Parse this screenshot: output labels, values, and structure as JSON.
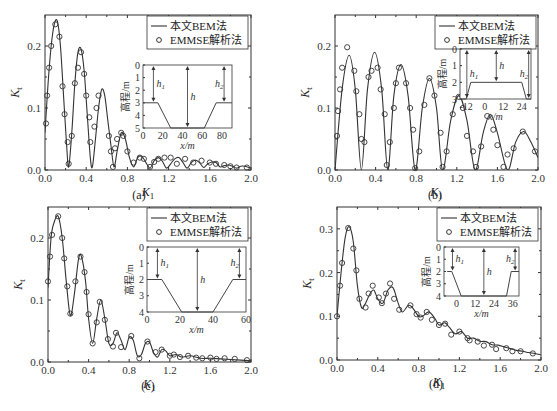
{
  "figure": {
    "legend": {
      "line_label": "本文BEM法",
      "marker_label": "EMMSE解析法"
    },
    "inset_ylabel": "高程/m",
    "inset_xlabel": "x/m",
    "inset_h1": "h",
    "inset_h": "h",
    "inset_h2": "h"
  },
  "chart_data": [
    {
      "id": "a",
      "caption": "(a)",
      "type": "line",
      "xlabel": "K_1",
      "ylabel": "K_t",
      "xlim": [
        0,
        2.0
      ],
      "ylim": [
        0,
        0.25
      ],
      "xticks": [
        "0.0",
        "0.4",
        "0.8",
        "1.2",
        "1.6",
        "2.0"
      ],
      "yticks": [
        "0.0",
        "0.1",
        "0.2"
      ],
      "legend_position": "upper right",
      "series": [
        {
          "name": "本文BEM法",
          "style": "line",
          "x": [
            0,
            0.03,
            0.06,
            0.09,
            0.12,
            0.15,
            0.18,
            0.21,
            0.23,
            0.26,
            0.29,
            0.32,
            0.35,
            0.38,
            0.41,
            0.44,
            0.46,
            0.49,
            0.52,
            0.55,
            0.58,
            0.61,
            0.64,
            0.67,
            0.7,
            0.74,
            0.78,
            0.82,
            0.86,
            0.9,
            0.94,
            0.98,
            1.02,
            1.06,
            1.1,
            1.14,
            1.18,
            1.22,
            1.26,
            1.3,
            1.34,
            1.38,
            1.42,
            1.46,
            1.5,
            1.54,
            1.58,
            1.62,
            1.66,
            1.7,
            1.74,
            1.78,
            1.82,
            1.86,
            1.9,
            1.94,
            2.0
          ],
          "y": [
            0.06,
            0.14,
            0.2,
            0.235,
            0.24,
            0.2,
            0.12,
            0.04,
            0.005,
            0.06,
            0.14,
            0.19,
            0.195,
            0.16,
            0.09,
            0.02,
            0.005,
            0.05,
            0.1,
            0.13,
            0.12,
            0.08,
            0.04,
            0.005,
            0.03,
            0.06,
            0.05,
            0.02,
            0.005,
            0.02,
            0.022,
            0.012,
            0.003,
            0.015,
            0.02,
            0.014,
            0.003,
            0.01,
            0.018,
            0.02,
            0.012,
            0.003,
            0.012,
            0.016,
            0.012,
            0.004,
            0.01,
            0.013,
            0.012,
            0.005,
            0.007,
            0.008,
            0.006,
            0.003,
            0.006,
            0.006,
            0.003
          ]
        },
        {
          "name": "EMMSE解析法",
          "style": "marker",
          "x": [
            0.01,
            0.02,
            0.04,
            0.06,
            0.1,
            0.14,
            0.17,
            0.19,
            0.22,
            0.23,
            0.26,
            0.29,
            0.32,
            0.35,
            0.38,
            0.4,
            0.43,
            0.44,
            0.48,
            0.5,
            0.52,
            0.62,
            0.64,
            0.66,
            0.68,
            0.7,
            0.74,
            0.76,
            0.8,
            0.86,
            0.92,
            0.96,
            1.02,
            1.06,
            1.1,
            1.16,
            1.22,
            1.28,
            1.36,
            1.44,
            1.52,
            1.6,
            1.66,
            1.74,
            1.8,
            1.86,
            1.96
          ],
          "y": [
            0.075,
            0.12,
            0.165,
            0.2,
            0.235,
            0.215,
            0.135,
            0.09,
            0.045,
            0.01,
            0.055,
            0.14,
            0.165,
            0.19,
            0.155,
            0.12,
            0.085,
            0.045,
            0.07,
            0.1,
            0.12,
            0.055,
            0.03,
            0.005,
            0.035,
            0.05,
            0.06,
            0.055,
            0.03,
            0.012,
            0.02,
            0.018,
            0.005,
            0.013,
            0.018,
            0.02,
            0.02,
            0.01,
            0.018,
            0.012,
            0.015,
            0.012,
            0.01,
            0.008,
            0.006,
            0.004,
            0.004
          ]
        }
      ],
      "inset": {
        "xticks": [
          "0",
          "20",
          "40",
          "60",
          "80"
        ],
        "yticks": [
          "0",
          "1",
          "2",
          "3",
          "4",
          "5"
        ],
        "profile": [
          [
            0,
            3
          ],
          [
            15,
            3
          ],
          [
            28,
            5
          ],
          [
            62,
            5
          ],
          [
            74,
            3
          ],
          [
            90,
            3
          ]
        ]
      }
    },
    {
      "id": "b",
      "caption": "(b)",
      "type": "line",
      "xlabel": "K_1",
      "ylabel": "K_t",
      "xlim": [
        0,
        2.0
      ],
      "ylim": [
        0,
        0.25
      ],
      "xticks": [
        "0.0",
        "0.4",
        "0.8",
        "1.2",
        "1.6",
        "2.0"
      ],
      "yticks": [
        "0.0",
        "0.1",
        "0.2"
      ],
      "legend_position": "upper right",
      "series": [
        {
          "name": "本文BEM法",
          "style": "line",
          "x": [
            0,
            0.07,
            0.14,
            0.2,
            0.26,
            0.32,
            0.39,
            0.46,
            0.52,
            0.58,
            0.65,
            0.72,
            0.79,
            0.86,
            0.93,
            1.0,
            1.06,
            1.14,
            1.22,
            1.3,
            1.38,
            1.46,
            1.53,
            1.6,
            1.7,
            1.78,
            1.86,
            1.93,
            2.0
          ],
          "y": [
            0,
            0.13,
            0.185,
            0.13,
            0.0,
            0.13,
            0.19,
            0.13,
            0.0,
            0.12,
            0.17,
            0.12,
            0.0,
            0.1,
            0.148,
            0.1,
            0.0,
            0.08,
            0.12,
            0.08,
            0.0,
            0.06,
            0.09,
            0.06,
            0.0,
            0.045,
            0.062,
            0.045,
            0.02
          ]
        },
        {
          "name": "EMMSE解析法",
          "style": "marker",
          "x": [
            0.02,
            0.03,
            0.05,
            0.07,
            0.12,
            0.19,
            0.21,
            0.24,
            0.26,
            0.29,
            0.33,
            0.36,
            0.42,
            0.45,
            0.49,
            0.51,
            0.54,
            0.58,
            0.6,
            0.63,
            0.7,
            0.74,
            0.77,
            0.79,
            0.83,
            0.88,
            0.93,
            0.98,
            1.04,
            1.06,
            1.1,
            1.16,
            1.22,
            1.26,
            1.3,
            1.36,
            1.39,
            1.44,
            1.5,
            1.56,
            1.6,
            1.66,
            1.7,
            1.76,
            1.85,
            1.97
          ],
          "y": [
            0.055,
            0.095,
            0.13,
            0.165,
            0.198,
            0.16,
            0.127,
            0.09,
            0.05,
            0.045,
            0.15,
            0.16,
            0.165,
            0.13,
            0.09,
            0.008,
            0.045,
            0.1,
            0.14,
            0.165,
            0.14,
            0.1,
            0.065,
            0.003,
            0.03,
            0.105,
            0.148,
            0.12,
            0.06,
            0.005,
            0.03,
            0.09,
            0.118,
            0.1,
            0.055,
            0.03,
            0.005,
            0.038,
            0.087,
            0.065,
            0.04,
            0.005,
            0.025,
            0.035,
            0.062,
            0.03
          ]
        }
      ],
      "inset": {
        "xticks": [
          "-12",
          "0",
          "12",
          "24"
        ],
        "yticks": [
          "0",
          "1",
          "2",
          "3"
        ],
        "profile": [
          [
            -15,
            3
          ],
          [
            -12,
            3
          ],
          [
            -9,
            2
          ],
          [
            24,
            2
          ],
          [
            27,
            3
          ],
          [
            30,
            3
          ]
        ]
      }
    },
    {
      "id": "c",
      "caption": "(c)",
      "type": "line",
      "xlabel": "K_1",
      "ylabel": "K_t",
      "xlim": [
        0,
        2.0
      ],
      "ylim": [
        0,
        0.25
      ],
      "xticks": [
        "0.0",
        "0.4",
        "0.8",
        "1.2",
        "1.6",
        "2.0"
      ],
      "yticks": [
        "0.0",
        "0.1",
        "0.2"
      ],
      "legend_position": "upper right",
      "series": [
        {
          "name": "本文BEM法",
          "style": "line",
          "x": [
            0,
            0.03,
            0.06,
            0.1,
            0.14,
            0.18,
            0.22,
            0.26,
            0.3,
            0.33,
            0.37,
            0.4,
            0.44,
            0.48,
            0.52,
            0.56,
            0.6,
            0.64,
            0.68,
            0.72,
            0.76,
            0.8,
            0.84,
            0.88,
            0.92,
            0.96,
            1.0,
            1.04,
            1.08,
            1.12,
            1.16,
            1.2,
            1.26,
            1.32,
            1.4,
            1.5,
            1.6,
            1.7,
            1.8,
            1.9,
            2.0
          ],
          "y": [
            0.12,
            0.2,
            0.225,
            0.235,
            0.2,
            0.13,
            0.075,
            0.11,
            0.165,
            0.17,
            0.13,
            0.07,
            0.03,
            0.07,
            0.1,
            0.07,
            0.03,
            0.03,
            0.047,
            0.035,
            0.02,
            0.04,
            0.035,
            0.01,
            0.012,
            0.03,
            0.032,
            0.015,
            0.008,
            0.02,
            0.018,
            0.01,
            0.012,
            0.008,
            0.01,
            0.006,
            0.006,
            0.005,
            0.004,
            0.003,
            0.002
          ]
        },
        {
          "name": "EMMSE解析法",
          "style": "marker",
          "x": [
            0.0,
            0.02,
            0.04,
            0.1,
            0.14,
            0.16,
            0.19,
            0.22,
            0.27,
            0.32,
            0.36,
            0.38,
            0.4,
            0.44,
            0.48,
            0.51,
            0.56,
            0.59,
            0.64,
            0.67,
            0.72,
            0.82,
            0.9,
            0.98,
            1.06,
            1.12,
            1.2,
            1.24,
            1.3,
            1.38,
            1.46,
            1.52,
            1.6,
            1.66,
            1.74,
            1.84,
            1.96
          ],
          "y": [
            0.13,
            0.17,
            0.205,
            0.235,
            0.2,
            0.167,
            0.122,
            0.078,
            0.13,
            0.17,
            0.145,
            0.113,
            0.077,
            0.03,
            0.064,
            0.097,
            0.068,
            0.037,
            0.025,
            0.047,
            0.024,
            0.042,
            0.006,
            0.033,
            0.016,
            0.02,
            0.01,
            0.012,
            0.008,
            0.01,
            0.007,
            0.006,
            0.007,
            0.005,
            0.006,
            0.005,
            0.003
          ]
        }
      ],
      "inset": {
        "xticks": [
          "0",
          "20",
          "40",
          "60"
        ],
        "yticks": [
          "0",
          "1",
          "2",
          "3",
          "4"
        ],
        "profile": [
          [
            0,
            2
          ],
          [
            9,
            2
          ],
          [
            21,
            4
          ],
          [
            40,
            4
          ],
          [
            52,
            2
          ],
          [
            60,
            2
          ]
        ]
      }
    },
    {
      "id": "d",
      "caption": "(d)",
      "type": "line",
      "xlabel": "K_1",
      "ylabel": "K_t",
      "xlim": [
        0,
        2.0
      ],
      "ylim": [
        0,
        0.35
      ],
      "xticks": [
        "0.0",
        "0.4",
        "0.8",
        "1.2",
        "1.6",
        "2.0"
      ],
      "yticks": [
        "0.0",
        "0.1",
        "0.2",
        "0.3"
      ],
      "legend_position": "upper right",
      "series": [
        {
          "name": "本文BEM法",
          "style": "line",
          "x": [
            0,
            0.04,
            0.08,
            0.12,
            0.16,
            0.2,
            0.24,
            0.28,
            0.32,
            0.36,
            0.4,
            0.45,
            0.5,
            0.55,
            0.6,
            0.64,
            0.7,
            0.74,
            0.8,
            0.84,
            0.9,
            0.96,
            1.0,
            1.06,
            1.1,
            1.16,
            1.22,
            1.28,
            1.34,
            1.4,
            1.46,
            1.52,
            1.58,
            1.64,
            1.7,
            1.76,
            1.82,
            1.88,
            1.94,
            2.0
          ],
          "y": [
            0.1,
            0.2,
            0.28,
            0.305,
            0.27,
            0.17,
            0.12,
            0.13,
            0.15,
            0.16,
            0.14,
            0.13,
            0.16,
            0.165,
            0.13,
            0.11,
            0.125,
            0.12,
            0.1,
            0.1,
            0.11,
            0.095,
            0.08,
            0.085,
            0.075,
            0.06,
            0.065,
            0.05,
            0.05,
            0.043,
            0.042,
            0.035,
            0.034,
            0.03,
            0.026,
            0.022,
            0.02,
            0.017,
            0.015,
            0.012
          ]
        },
        {
          "name": "EMMSE解析法",
          "style": "marker",
          "x": [
            0.0,
            0.03,
            0.05,
            0.11,
            0.16,
            0.19,
            0.22,
            0.28,
            0.31,
            0.35,
            0.41,
            0.44,
            0.48,
            0.52,
            0.56,
            0.61,
            0.72,
            0.78,
            0.82,
            0.88,
            0.93,
            1.0,
            1.06,
            1.12,
            1.2,
            1.28,
            1.3,
            1.38,
            1.44,
            1.52,
            1.56,
            1.66,
            1.72,
            1.8,
            1.92
          ],
          "y": [
            0.1,
            0.17,
            0.222,
            0.302,
            0.255,
            0.205,
            0.14,
            0.12,
            0.152,
            0.17,
            0.143,
            0.13,
            0.152,
            0.175,
            0.14,
            0.115,
            0.125,
            0.105,
            0.097,
            0.11,
            0.092,
            0.08,
            0.083,
            0.058,
            0.065,
            0.05,
            0.045,
            0.042,
            0.033,
            0.035,
            0.025,
            0.027,
            0.02,
            0.02,
            0.015
          ]
        }
      ],
      "inset": {
        "xticks": [
          "0",
          "12",
          "24",
          "36"
        ],
        "yticks": [
          "0",
          "1",
          "2",
          "3",
          "4"
        ],
        "profile": [
          [
            -6,
            2
          ],
          [
            -3,
            2
          ],
          [
            3,
            4
          ],
          [
            32,
            4
          ],
          [
            35,
            2
          ],
          [
            40,
            2
          ]
        ]
      }
    }
  ]
}
